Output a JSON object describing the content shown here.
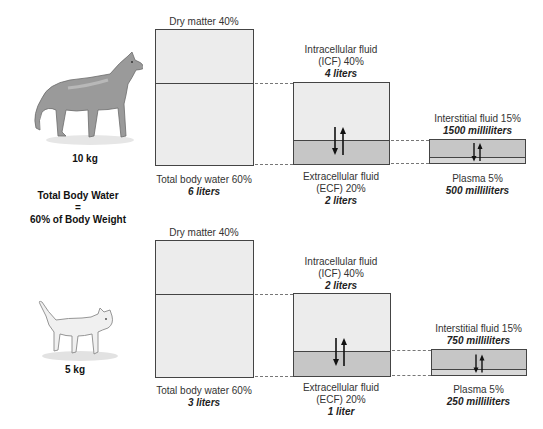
{
  "summary": {
    "line1": "Total Body Water",
    "line2": "=",
    "line3": "60% of Body Weight"
  },
  "panels": [
    {
      "animal": "dog",
      "animal_icon": "dog-illustration",
      "weight": "10 kg",
      "dry_matter": "Dry matter 40%",
      "total_water": {
        "label": "Total body water 60%",
        "amount": "6 liters"
      },
      "icf": {
        "line1": "Intracellular fluid",
        "line2": "(ICF) 40%",
        "amount": "4 liters"
      },
      "ecf": {
        "line1": "Extracellular fluid",
        "line2": "(ECF) 20%",
        "amount": "2 liters"
      },
      "interstitial": {
        "label": "Interstitial fluid 15%",
        "amount": "1500 milliliters"
      },
      "plasma": {
        "label": "Plasma 5%",
        "amount": "500 milliliters"
      }
    },
    {
      "animal": "cat",
      "animal_icon": "cat-illustration",
      "weight": "5 kg",
      "dry_matter": "Dry matter 40%",
      "total_water": {
        "label": "Total body water 60%",
        "amount": "3 liters"
      },
      "icf": {
        "line1": "Intracellular fluid",
        "line2": "(ICF) 40%",
        "amount": "2 liters"
      },
      "ecf": {
        "line1": "Extracellular fluid",
        "line2": "(ECF) 20%",
        "amount": "1 liter"
      },
      "interstitial": {
        "label": "Interstitial fluid 15%",
        "amount": "750 milliliters"
      },
      "plasma": {
        "label": "Plasma 5%",
        "amount": "250 milliliters"
      }
    }
  ],
  "colors": {
    "light_fill": "#ececec",
    "ecf_fill": "#c6c6c6",
    "plasma_fill": "#d8d8d8",
    "border": "#444444"
  }
}
